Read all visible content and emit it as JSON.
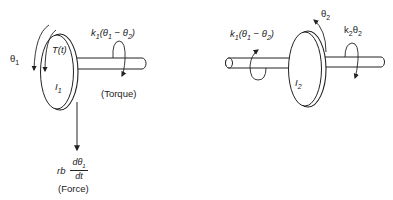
{
  "diagram": {
    "type": "two-inertia torsional system (free-body diagrams)",
    "left_body": {
      "angle_label": "θ1",
      "torque_input_label": "T(t)",
      "inertia_label": "I1",
      "spring_torque_label": "k1(θ1 − θ2)",
      "spring_torque_caption": "(Torque)",
      "damping_force_prefix": "rb",
      "damping_force_numerator": "dθ1",
      "damping_force_denominator": "dt",
      "damping_force_caption": "(Force)"
    },
    "right_body": {
      "angle_label": "θ2",
      "inertia_label": "I2",
      "left_spring_torque_label": "k1(θ1 − θ2)",
      "right_spring_torque_label": "k2θ2"
    },
    "colors": {
      "line": "#222222",
      "background": "#ffffff"
    }
  }
}
